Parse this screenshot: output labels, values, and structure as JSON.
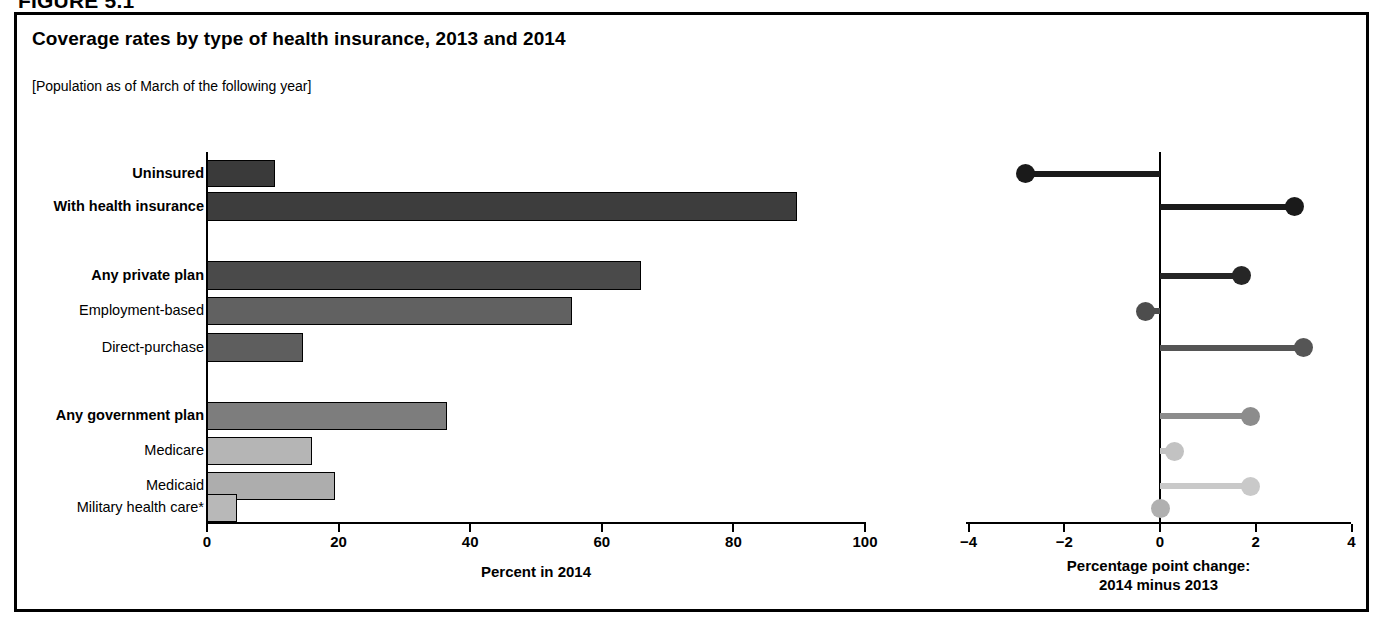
{
  "figure_label": "FIGURE 5.1",
  "title": "Coverage rates by type of health insurance, 2013 and 2014",
  "subtitle": "[Population as of March of the following year]",
  "left_axis_title": "Percent in 2014",
  "right_axis_title_line1": "Percentage point change:",
  "right_axis_title_line2": "2014 minus 2013",
  "chart_data": {
    "type": "bar",
    "title": "Coverage rates by type of health insurance, 2013 and 2014",
    "subtitle": "[Population as of March of the following year]",
    "categories": [
      "Uninsured",
      "With health insurance",
      "Any private plan",
      "Employment-based",
      "Direct-purchase",
      "Any government plan",
      "Medicare",
      "Medicaid",
      "Military health care*"
    ],
    "series": [
      {
        "name": "Percent in 2014",
        "xlabel": "Percent in 2014",
        "xlim": [
          0,
          100
        ],
        "ticks": [
          0,
          20,
          40,
          60,
          80,
          100
        ],
        "values": [
          10.4,
          89.6,
          66.0,
          55.4,
          14.6,
          36.5,
          16.0,
          19.5,
          4.5
        ]
      },
      {
        "name": "Percentage point change: 2014 minus 2013",
        "xlabel": "Percentage point change: 2014 minus 2013",
        "xlim": [
          -4,
          4
        ],
        "ticks": [
          -4,
          -2,
          0,
          2,
          4
        ],
        "values": [
          -2.8,
          2.8,
          1.7,
          -0.3,
          3.0,
          1.9,
          0.3,
          1.9,
          0.0
        ]
      }
    ],
    "grid": false,
    "legend": "none"
  },
  "rows": [
    {
      "label": "Uninsured",
      "bold": true,
      "top": 160,
      "height": 27,
      "value": 10.4,
      "change": -2.8,
      "fill": "#3a3a3a",
      "dot": "#1a1a1a"
    },
    {
      "label": "With health insurance",
      "bold": true,
      "top": 192,
      "height": 29,
      "value": 89.6,
      "change": 2.8,
      "fill": "#3d3d3d",
      "dot": "#1a1a1a"
    },
    {
      "label": "Any private plan",
      "bold": true,
      "top": 261,
      "height": 29,
      "value": 66.0,
      "change": 1.7,
      "fill": "#4a4a4a",
      "dot": "#262626"
    },
    {
      "label": "Employment-based",
      "bold": false,
      "top": 297,
      "height": 28,
      "value": 55.4,
      "change": -0.3,
      "fill": "#616161",
      "dot": "#4d4d4d"
    },
    {
      "label": "Direct-purchase",
      "bold": false,
      "top": 333,
      "height": 29,
      "value": 14.6,
      "change": 3.0,
      "fill": "#5e5e5e",
      "dot": "#555555"
    },
    {
      "label": "Any government plan",
      "bold": true,
      "top": 402,
      "height": 28,
      "value": 36.5,
      "change": 1.9,
      "fill": "#7d7d7d",
      "dot": "#8c8c8c"
    },
    {
      "label": "Medicare",
      "bold": false,
      "top": 437,
      "height": 28,
      "value": 16.0,
      "change": 0.3,
      "fill": "#b5b5b5",
      "dot": "#c2c2c2"
    },
    {
      "label": "Medicaid",
      "bold": false,
      "top": 472,
      "height": 28,
      "value": 19.5,
      "change": 1.9,
      "fill": "#adadad",
      "dot": "#c9c9c9"
    },
    {
      "label": "Military health care*",
      "bold": false,
      "top": 494,
      "height": 28,
      "value": 4.5,
      "change": 0.0,
      "fill": "#b8b8b8",
      "dot": "#b0b0b0"
    }
  ],
  "left_ticks": [
    {
      "label": "0",
      "value": 0
    },
    {
      "label": "20",
      "value": 20
    },
    {
      "label": "40",
      "value": 40
    },
    {
      "label": "60",
      "value": 60
    },
    {
      "label": "80",
      "value": 80
    },
    {
      "label": "100",
      "value": 100
    }
  ],
  "right_ticks": [
    {
      "label": "−4",
      "value": -4
    },
    {
      "label": "−2",
      "value": -2
    },
    {
      "label": "0",
      "value": 0
    },
    {
      "label": "2",
      "value": 2
    },
    {
      "label": "4",
      "value": 4
    }
  ]
}
